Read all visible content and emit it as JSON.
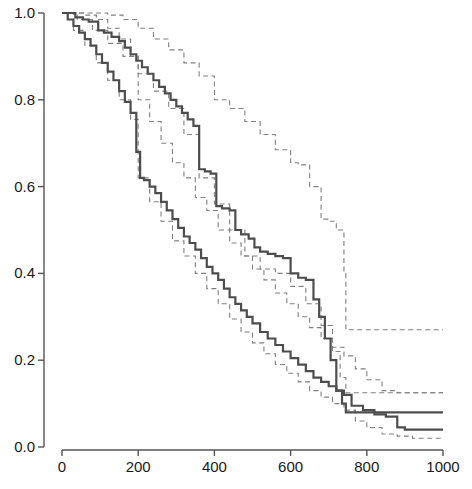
{
  "chart_data": {
    "type": "line",
    "title": "",
    "subtitle": "",
    "xlabel": "",
    "ylabel": "",
    "xlim": [
      0,
      1000
    ],
    "ylim": [
      0.0,
      1.0
    ],
    "grid": false,
    "legend": "none",
    "step_style": "post",
    "xticks": [
      0,
      200,
      400,
      600,
      800,
      1000
    ],
    "xtick_labels": [
      "0",
      "200",
      "400",
      "600",
      "800",
      "1000"
    ],
    "yticks": [
      0.0,
      0.2,
      0.4,
      0.6,
      0.8,
      1.0
    ],
    "ytick_labels": [
      "0.0",
      "0.2",
      "0.4",
      "0.6",
      "0.8",
      "1.0"
    ],
    "colors": {
      "axis": "#555555",
      "solid_curve": "#4d4d4d",
      "dashed_band": "#808080",
      "text": "#1a1a1a",
      "background": "#ffffff"
    },
    "series": [
      {
        "name": "group-1-survival",
        "style": "solid",
        "linewidth": 2.2,
        "color": "#4d4d4d",
        "x": [
          0,
          20,
          35,
          55,
          70,
          95,
          110,
          130,
          150,
          165,
          180,
          195,
          210,
          225,
          240,
          255,
          270,
          285,
          300,
          315,
          330,
          345,
          360,
          375,
          390,
          405,
          420,
          440,
          455,
          470,
          490,
          505,
          520,
          540,
          560,
          580,
          600,
          620,
          640,
          660,
          675,
          690,
          705,
          720,
          735,
          745,
          1000
        ],
        "y": [
          1.0,
          1.0,
          0.99,
          0.985,
          0.98,
          0.96,
          0.955,
          0.945,
          0.935,
          0.92,
          0.905,
          0.89,
          0.875,
          0.86,
          0.845,
          0.83,
          0.815,
          0.8,
          0.785,
          0.77,
          0.755,
          0.74,
          0.64,
          0.635,
          0.63,
          0.555,
          0.55,
          0.545,
          0.5,
          0.49,
          0.48,
          0.46,
          0.45,
          0.445,
          0.44,
          0.435,
          0.4,
          0.39,
          0.385,
          0.34,
          0.3,
          0.25,
          0.2,
          0.13,
          0.1,
          0.08,
          0.08
        ]
      },
      {
        "name": "group-2-survival",
        "style": "solid",
        "linewidth": 2.2,
        "color": "#4d4d4d",
        "x": [
          0,
          15,
          30,
          45,
          60,
          75,
          90,
          105,
          120,
          135,
          150,
          165,
          180,
          195,
          205,
          215,
          230,
          245,
          260,
          275,
          290,
          305,
          320,
          335,
          350,
          365,
          380,
          395,
          410,
          425,
          440,
          455,
          470,
          485,
          500,
          520,
          540,
          560,
          580,
          600,
          620,
          640,
          660,
          680,
          700,
          720,
          740,
          760,
          790,
          820,
          850,
          880,
          900,
          1000
        ],
        "y": [
          1.0,
          0.985,
          0.97,
          0.955,
          0.94,
          0.925,
          0.905,
          0.885,
          0.865,
          0.845,
          0.82,
          0.795,
          0.77,
          0.68,
          0.62,
          0.615,
          0.6,
          0.585,
          0.565,
          0.545,
          0.525,
          0.505,
          0.485,
          0.47,
          0.455,
          0.435,
          0.415,
          0.4,
          0.385,
          0.365,
          0.345,
          0.33,
          0.315,
          0.3,
          0.285,
          0.265,
          0.25,
          0.235,
          0.22,
          0.205,
          0.19,
          0.175,
          0.16,
          0.15,
          0.14,
          0.13,
          0.12,
          0.095,
          0.085,
          0.075,
          0.07,
          0.045,
          0.04,
          0.04
        ]
      },
      {
        "name": "group-1-ci-upper",
        "style": "dashed",
        "linewidth": 1.1,
        "color": "#808080",
        "x": [
          0,
          40,
          80,
          120,
          160,
          200,
          240,
          280,
          320,
          360,
          400,
          440,
          480,
          520,
          560,
          600,
          620,
          650,
          680,
          700,
          720,
          740,
          745,
          1000
        ],
        "y": [
          1.0,
          1.0,
          1.0,
          0.995,
          0.985,
          0.965,
          0.94,
          0.915,
          0.885,
          0.855,
          0.8,
          0.78,
          0.75,
          0.72,
          0.685,
          0.655,
          0.65,
          0.6,
          0.525,
          0.52,
          0.5,
          0.4,
          0.27,
          0.27
        ]
      },
      {
        "name": "group-1-ci-lower",
        "style": "dashed",
        "linewidth": 1.1,
        "color": "#808080",
        "x": [
          0,
          40,
          80,
          120,
          160,
          200,
          240,
          280,
          320,
          360,
          400,
          440,
          480,
          520,
          560,
          600,
          640,
          680,
          710,
          730,
          745,
          760,
          800,
          850,
          900,
          1000
        ],
        "y": [
          1.0,
          0.985,
          0.96,
          0.93,
          0.9,
          0.86,
          0.82,
          0.78,
          0.72,
          0.62,
          0.56,
          0.5,
          0.44,
          0.41,
          0.4,
          0.37,
          0.33,
          0.28,
          0.22,
          0.16,
          0.125,
          0.125,
          0.125,
          0.125,
          0.125,
          0.125
        ]
      },
      {
        "name": "group-2-ci-upper",
        "style": "dashed",
        "linewidth": 1.1,
        "color": "#808080",
        "x": [
          0,
          30,
          60,
          90,
          120,
          150,
          180,
          200,
          230,
          260,
          290,
          320,
          350,
          380,
          410,
          440,
          470,
          500,
          530,
          560,
          590,
          620,
          650,
          680,
          710,
          740,
          770,
          800,
          840,
          880,
          1000
        ],
        "y": [
          1.0,
          1.0,
          0.995,
          0.985,
          0.965,
          0.94,
          0.9,
          0.8,
          0.75,
          0.7,
          0.655,
          0.62,
          0.575,
          0.545,
          0.5,
          0.47,
          0.44,
          0.41,
          0.385,
          0.355,
          0.33,
          0.3,
          0.275,
          0.25,
          0.23,
          0.21,
          0.18,
          0.155,
          0.13,
          0.125,
          0.125
        ]
      },
      {
        "name": "group-2-ci-lower",
        "style": "dashed",
        "linewidth": 1.1,
        "color": "#808080",
        "x": [
          0,
          30,
          60,
          90,
          120,
          150,
          180,
          200,
          230,
          260,
          290,
          320,
          350,
          380,
          410,
          440,
          470,
          500,
          530,
          560,
          590,
          620,
          650,
          680,
          710,
          740,
          770,
          800,
          840,
          880,
          920,
          1000
        ],
        "y": [
          1.0,
          0.96,
          0.925,
          0.885,
          0.845,
          0.8,
          0.755,
          0.62,
          0.565,
          0.52,
          0.475,
          0.44,
          0.4,
          0.365,
          0.33,
          0.295,
          0.265,
          0.24,
          0.215,
          0.19,
          0.17,
          0.15,
          0.13,
          0.115,
          0.1,
          0.085,
          0.06,
          0.045,
          0.03,
          0.025,
          0.02,
          0.02
        ]
      }
    ]
  }
}
